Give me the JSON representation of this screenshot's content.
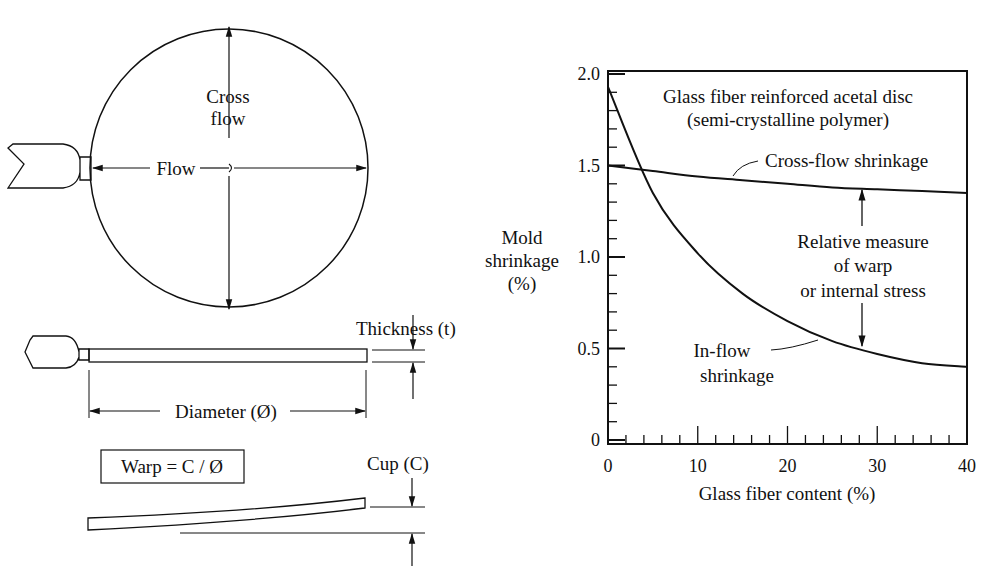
{
  "left_diagram": {
    "top_view": {
      "cross_flow_label_line1": "Cross",
      "cross_flow_label_line2": "flow",
      "flow_label": "Flow"
    },
    "side_view": {
      "thickness_label": "Thickness (t)",
      "diameter_label": "Diameter (Ø)"
    },
    "warp_view": {
      "formula": "Warp = C / Ø",
      "cup_label": "Cup (C)"
    }
  },
  "chart_data": {
    "type": "line",
    "title": "Glass fiber reinforced acetal disc",
    "subtitle": "(semi-crystalline polymer)",
    "xlabel": "Glass fiber content (%)",
    "ylabel": "Mold shrinkage (%)",
    "ylabel_lines": [
      "Mold",
      "shrinkage",
      "(%)"
    ],
    "xlim": [
      0,
      40
    ],
    "ylim": [
      0,
      2.0
    ],
    "x_ticks": [
      "0",
      "10",
      "20",
      "30",
      "40"
    ],
    "y_ticks": [
      "0",
      "0.5",
      "1.0",
      "1.5",
      "2.0"
    ],
    "grid": false,
    "x": [
      0,
      5,
      10,
      15,
      20,
      25,
      30,
      35,
      40
    ],
    "series": [
      {
        "name": "Cross-flow shrinkage",
        "values": [
          1.5,
          1.47,
          1.44,
          1.42,
          1.4,
          1.38,
          1.37,
          1.36,
          1.35
        ]
      },
      {
        "name": "In-flow shrinkage",
        "values": [
          1.93,
          1.35,
          1.02,
          0.8,
          0.65,
          0.54,
          0.47,
          0.42,
          0.4
        ]
      }
    ],
    "annotations": [
      {
        "text": "Cross-flow shrinkage",
        "target": "cross-flow curve"
      },
      {
        "text_lines": [
          "In-flow",
          "shrinkage"
        ],
        "target": "in-flow curve"
      },
      {
        "text_lines": [
          "Relative measure",
          "of warp",
          "or internal stress"
        ],
        "at_x": 28,
        "between": [
          "Cross-flow shrinkage",
          "In-flow shrinkage"
        ]
      }
    ]
  }
}
